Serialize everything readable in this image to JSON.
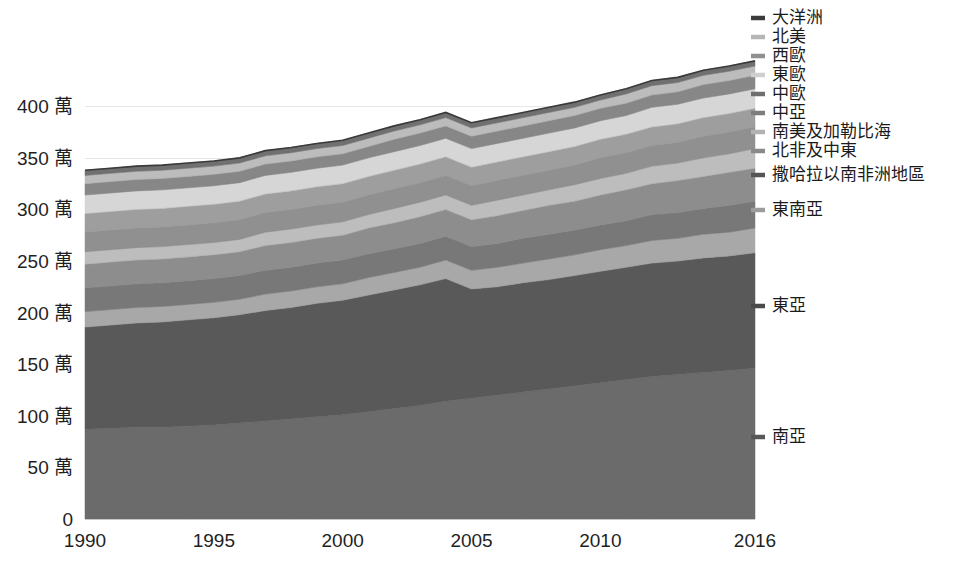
{
  "chart_data": {
    "type": "area",
    "stacked": true,
    "title": "",
    "subtitle": "",
    "xlabel": "",
    "ylabel": "",
    "grid": true,
    "legend_position": "right",
    "x": [
      1990,
      1991,
      1992,
      1993,
      1994,
      1995,
      1996,
      1997,
      1998,
      1999,
      2000,
      2001,
      2002,
      2003,
      2004,
      2005,
      2006,
      2007,
      2008,
      2009,
      2010,
      2011,
      2012,
      2013,
      2014,
      2015,
      2016
    ],
    "x_tick_labels": [
      "1990",
      "1995",
      "2000",
      "2005",
      "2010",
      "2016"
    ],
    "x_tick_values": [
      1990,
      1995,
      2000,
      2005,
      2010,
      2016
    ],
    "xlim": [
      1990,
      2016
    ],
    "ylim": [
      0,
      440
    ],
    "y_tick_labels": [
      "0",
      "50 萬",
      "100 萬",
      "150 萬",
      "200 萬",
      "250 萬",
      "300 萬",
      "350 萬",
      "400 萬"
    ],
    "y_tick_values": [
      0,
      50,
      100,
      150,
      200,
      250,
      300,
      350,
      400
    ],
    "y_unit_note": "萬",
    "series": [
      {
        "name": "南亞",
        "color": "#6b6b6b",
        "legend_marker_color": "#575757",
        "values": [
          87,
          88,
          89,
          89,
          90,
          91,
          93,
          95,
          97,
          99,
          101,
          104,
          107,
          110,
          114,
          117,
          120,
          123,
          126,
          129,
          132,
          135,
          138,
          140,
          142,
          144,
          146
        ]
      },
      {
        "name": "東亞",
        "color": "#595959",
        "legend_marker_color": "#4a4a4a",
        "values": [
          99,
          100,
          101,
          102,
          103,
          104,
          105,
          107,
          108,
          110,
          111,
          113,
          115,
          117,
          119,
          106,
          105,
          106,
          106,
          107,
          108,
          109,
          110,
          110,
          111,
          111,
          112
        ]
      },
      {
        "name": "東南亞",
        "color": "#a8a8a8",
        "legend_marker_color": "#9c9c9c",
        "values": [
          15,
          15,
          15,
          15,
          15,
          15,
          15,
          16,
          16,
          16,
          16,
          17,
          17,
          17,
          18,
          18,
          19,
          19,
          20,
          20,
          21,
          21,
          22,
          22,
          23,
          23,
          24
        ]
      },
      {
        "name": "撒哈拉以南非洲地區",
        "color": "#787878",
        "legend_marker_color": "#555555",
        "values": [
          23,
          23,
          23,
          23,
          23,
          23,
          23,
          23,
          23,
          23,
          23,
          23,
          23,
          23,
          23,
          23,
          23,
          24,
          24,
          24,
          24,
          24,
          25,
          25,
          25,
          26,
          26
        ]
      },
      {
        "name": "北非及中東",
        "color": "#8d8d8d",
        "legend_marker_color": "#8a8a8a",
        "values": [
          23,
          23,
          23,
          23,
          23,
          23,
          23,
          24,
          24,
          24,
          24,
          25,
          25,
          26,
          26,
          26,
          27,
          27,
          28,
          28,
          29,
          30,
          30,
          31,
          31,
          32,
          32
        ]
      },
      {
        "name": "南美及加勒比海",
        "color": "#bdbdbd",
        "legend_marker_color": "#b2b2b2",
        "values": [
          12,
          12,
          12,
          12,
          12,
          12,
          12,
          13,
          13,
          13,
          13,
          13,
          14,
          14,
          14,
          14,
          15,
          15,
          15,
          16,
          16,
          16,
          17,
          17,
          18,
          18,
          19
        ]
      },
      {
        "name": "中亞",
        "color": "#909090",
        "legend_marker_color": "#7d7d7d",
        "values": [
          19,
          19,
          19,
          19,
          19,
          19,
          19,
          19,
          19,
          19,
          19,
          19,
          19,
          19,
          19,
          19,
          19,
          19,
          19,
          19,
          20,
          20,
          20,
          20,
          21,
          21,
          21
        ]
      },
      {
        "name": "中歐",
        "color": "#9e9e9e",
        "legend_marker_color": "#6f6f6f",
        "values": [
          18,
          18,
          18,
          18,
          18,
          18,
          18,
          18,
          18,
          18,
          18,
          18,
          18,
          18,
          18,
          18,
          18,
          18,
          18,
          18,
          18,
          18,
          18,
          18,
          18,
          18,
          18
        ]
      },
      {
        "name": "東歐",
        "color": "#d6d6d6",
        "legend_marker_color": "#cfcfcf",
        "values": [
          18,
          18,
          18,
          18,
          18,
          18,
          18,
          18,
          18,
          18,
          18,
          18,
          18,
          18,
          18,
          18,
          18,
          18,
          18,
          18,
          18,
          18,
          19,
          19,
          19,
          19,
          19
        ]
      },
      {
        "name": "西歐",
        "color": "#878787",
        "legend_marker_color": "#8f8f8f",
        "values": [
          11,
          11,
          11,
          11,
          11,
          11,
          11,
          11,
          11,
          11,
          11,
          11,
          12,
          12,
          12,
          12,
          12,
          12,
          12,
          12,
          12,
          12,
          12,
          12,
          13,
          13,
          13
        ]
      },
      {
        "name": "北美",
        "color": "#bcbcbc",
        "legend_marker_color": "#b6b6b6",
        "values": [
          8,
          8,
          8,
          8,
          8,
          8,
          8,
          8,
          8,
          8,
          8,
          8,
          8,
          8,
          8,
          8,
          8,
          8,
          8,
          8,
          8,
          9,
          9,
          9,
          9,
          9,
          9
        ]
      },
      {
        "name": "大洋洲",
        "color": "#707070",
        "legend_marker_color": "#3b3b3b",
        "values": [
          5,
          5,
          5,
          5,
          5,
          5,
          5,
          5,
          5,
          5,
          5,
          5,
          5,
          5,
          5,
          5,
          5,
          5,
          5,
          5,
          5,
          5,
          5,
          5,
          5,
          5,
          5
        ]
      }
    ],
    "legend_entries": [
      {
        "label": "大洋洲",
        "color": "#3b3b3b"
      },
      {
        "label": "北美",
        "color": "#b6b6b6"
      },
      {
        "label": "西歐",
        "color": "#8f8f8f"
      },
      {
        "label": "東歐",
        "color": "#cfcfcf"
      },
      {
        "label": "中歐",
        "color": "#6f6f6f"
      },
      {
        "label": "中亞",
        "color": "#7d7d7d"
      },
      {
        "label": "南美及加勒比海",
        "color": "#b2b2b2"
      },
      {
        "label": "北非及中東",
        "color": "#8a8a8a"
      },
      {
        "label": "撒哈拉以南非洲地區",
        "color": "#555555"
      },
      {
        "label": "東南亞",
        "color": "#9c9c9c"
      },
      {
        "label": "東亞",
        "color": "#4a4a4a"
      },
      {
        "label": "南亞",
        "color": "#575757"
      }
    ]
  },
  "colors": {
    "background": "#ffffff",
    "gridline": "#e6e6e6",
    "axis_text": "#1f1f1f",
    "top_outline": "#3a3a3a"
  }
}
